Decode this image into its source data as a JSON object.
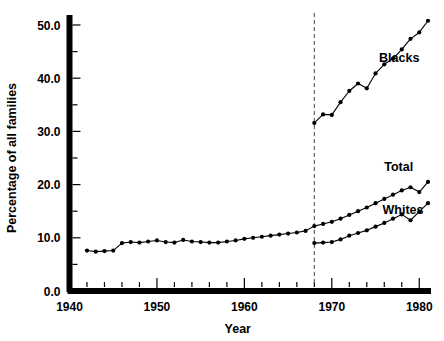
{
  "chart_data": {
    "type": "line",
    "title": "",
    "subtitle": "",
    "xlabel": "Year",
    "ylabel": "Percentage of all families",
    "xlim": [
      1940,
      1981
    ],
    "ylim": [
      0.0,
      52.5
    ],
    "grid": false,
    "legend_position": "inline-right",
    "x_ticks_major": [
      1940,
      1950,
      1960,
      1970,
      1980
    ],
    "x_tick_labels": [
      "1940",
      "1950",
      "1960",
      "1970",
      "1980"
    ],
    "x_tick_minor_step": 2,
    "y_ticks_major": [
      0.0,
      10.0,
      20.0,
      30.0,
      40.0,
      50.0
    ],
    "y_tick_labels": [
      "0.0",
      "10.0",
      "20.0",
      "30.0",
      "40.0",
      "50.0"
    ],
    "y_ticks_minor": [
      5.0,
      15.0,
      25.0,
      35.0,
      45.0
    ],
    "annotations": [
      {
        "name": "series-break-line",
        "type": "vline",
        "x": 1968,
        "style": "dashed",
        "color": "#555555"
      }
    ],
    "series": [
      {
        "name": "Blacks",
        "label": "Blacks",
        "label_x": 1975.4,
        "label_y": 43.0,
        "marker": "filled-circle",
        "color": "#000000",
        "x": [
          1968,
          1969,
          1970,
          1971,
          1972,
          1973,
          1974,
          1975,
          1976,
          1977,
          1978,
          1979,
          1980,
          1981
        ],
        "values": [
          31.6,
          33.2,
          33.1,
          35.5,
          37.6,
          39.0,
          38.1,
          40.9,
          42.6,
          43.7,
          45.4,
          47.4,
          48.6,
          50.8
        ]
      },
      {
        "name": "Total",
        "label": "Total",
        "label_x": 1976.0,
        "label_y": 22.6,
        "marker": "filled-circle",
        "color": "#000000",
        "x": [
          1942,
          1943,
          1944,
          1945,
          1946,
          1947,
          1948,
          1949,
          1950,
          1951,
          1952,
          1953,
          1954,
          1955,
          1956,
          1957,
          1958,
          1959,
          1960,
          1961,
          1962,
          1963,
          1964,
          1965,
          1966,
          1967,
          1968,
          1969,
          1970,
          1971,
          1972,
          1973,
          1974,
          1975,
          1976,
          1977,
          1978,
          1979,
          1980,
          1981
        ],
        "values": [
          7.6,
          7.4,
          7.5,
          7.6,
          9.0,
          9.2,
          9.1,
          9.3,
          9.5,
          9.2,
          9.1,
          9.6,
          9.3,
          9.2,
          9.1,
          9.1,
          9.3,
          9.5,
          9.8,
          10.0,
          10.2,
          10.4,
          10.6,
          10.8,
          11.0,
          11.3,
          12.2,
          12.6,
          13.0,
          13.6,
          14.3,
          15.0,
          15.7,
          16.5,
          17.3,
          18.1,
          18.9,
          19.5,
          18.6,
          20.5
        ]
      },
      {
        "name": "Whites",
        "label": "Whites",
        "label_x": 1975.8,
        "label_y": 14.4,
        "marker": "filled-circle",
        "color": "#000000",
        "x": [
          1968,
          1969,
          1970,
          1971,
          1972,
          1973,
          1974,
          1975,
          1976,
          1977,
          1978,
          1979,
          1980,
          1981
        ],
        "values": [
          9.0,
          9.1,
          9.2,
          9.7,
          10.4,
          10.9,
          11.4,
          12.1,
          12.8,
          13.6,
          14.4,
          13.3,
          14.9,
          16.5
        ]
      }
    ]
  },
  "axes": {
    "y_axis_title": "Percentage of all families",
    "x_axis_title": "Year"
  }
}
